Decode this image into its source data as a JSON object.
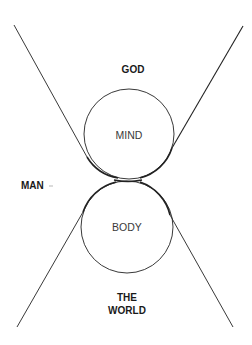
{
  "diagram": {
    "labels": {
      "god": "GOD",
      "mind": "MIND",
      "man": "MAN",
      "body": "BODY",
      "world_line1": "THE",
      "world_line2": "WORLD"
    },
    "colors": {
      "stroke": "#222222",
      "text_bold": "#1a1a1a",
      "text_inner": "#3a3a3a",
      "background": "#ffffff"
    },
    "shapes": {
      "mind_circle": {
        "cx": 129,
        "cy": 134,
        "r": 45
      },
      "body_circle": {
        "cx": 127,
        "cy": 227,
        "r": 46
      },
      "contact_point": {
        "x": 128,
        "y": 180
      },
      "lines": [
        {
          "name": "upper-left",
          "x1": 14,
          "y1": 25,
          "x2": 87,
          "y2": 157
        },
        {
          "name": "upper-right",
          "x1": 243,
          "y1": 26,
          "x2": 172,
          "y2": 148
        },
        {
          "name": "lower-left",
          "x1": 17,
          "y1": 327,
          "x2": 83,
          "y2": 212
        },
        {
          "name": "lower-right",
          "x1": 233,
          "y1": 327,
          "x2": 170,
          "y2": 215
        }
      ]
    }
  }
}
